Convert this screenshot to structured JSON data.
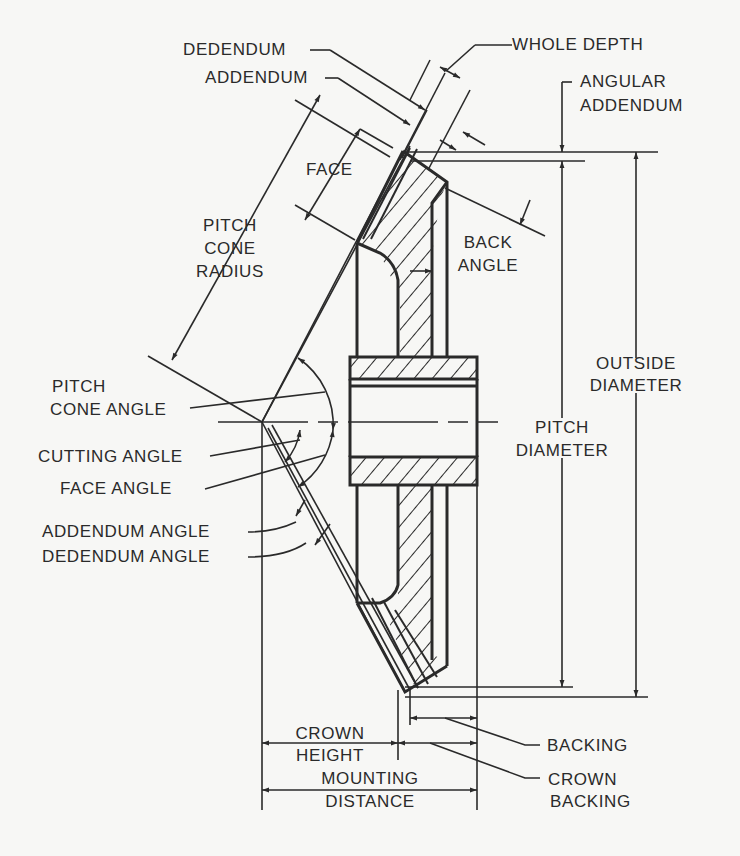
{
  "diagram": {
    "colors": {
      "line": "#2a2a2a",
      "background": "#f7f7f5"
    },
    "labels": {
      "dedendum": "DEDENDUM",
      "addendum": "ADDENDUM",
      "whole_depth": "WHOLE DEPTH",
      "angular_addendum_1": "ANGULAR",
      "angular_addendum_2": "ADDENDUM",
      "face": "FACE",
      "pitch_cone_radius_1": "PITCH",
      "pitch_cone_radius_2": "CONE",
      "pitch_cone_radius_3": "RADIUS",
      "back_angle_1": "BACK",
      "back_angle_2": "ANGLE",
      "outside_diameter_1": "OUTSIDE",
      "outside_diameter_2": "DIAMETER",
      "pitch_cone_angle_1": "PITCH",
      "pitch_cone_angle_2": "CONE ANGLE",
      "pitch_diameter_1": "PITCH",
      "pitch_diameter_2": "DIAMETER",
      "cutting_angle": "CUTTING ANGLE",
      "face_angle": "FACE ANGLE",
      "addendum_angle": "ADDENDUM ANGLE",
      "dedendum_angle": "DEDENDUM ANGLE",
      "crown_height_1": "CROWN",
      "crown_height_2": "HEIGHT",
      "backing": "BACKING",
      "mounting_distance_1": "MOUNTING",
      "mounting_distance_2": "DISTANCE",
      "crown_backing_1": "CROWN",
      "crown_backing_2": "BACKING"
    }
  }
}
